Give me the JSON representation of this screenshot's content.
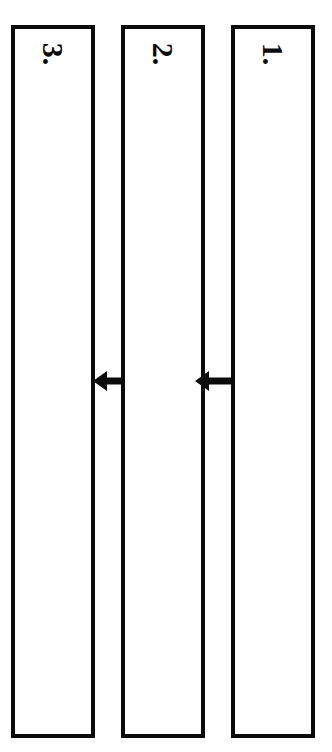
{
  "diagram": {
    "background_color": "#ffffff",
    "stroke_color": "#0a0a0a",
    "panels": [
      {
        "id": "panel-1",
        "label": "1.",
        "order": 1,
        "x": 231,
        "y": 25,
        "width": 84,
        "height": 713,
        "content": ""
      },
      {
        "id": "panel-2",
        "label": "2.",
        "order": 2,
        "x": 121,
        "y": 25,
        "width": 84,
        "height": 713,
        "content": ""
      },
      {
        "id": "panel-3",
        "label": "3.",
        "order": 3,
        "x": 11,
        "y": 25,
        "width": 84,
        "height": 713,
        "content": ""
      }
    ],
    "arrows": [
      {
        "id": "arrow-1-to-2",
        "direction": "left",
        "from_panel": "1.",
        "to_panel": "2.",
        "x": 195,
        "y": 369,
        "width": 36
      },
      {
        "id": "arrow-2-to-3",
        "direction": "left",
        "from_panel": "2.",
        "to_panel": "3.",
        "x": 93,
        "y": 369,
        "width": 29
      }
    ]
  }
}
